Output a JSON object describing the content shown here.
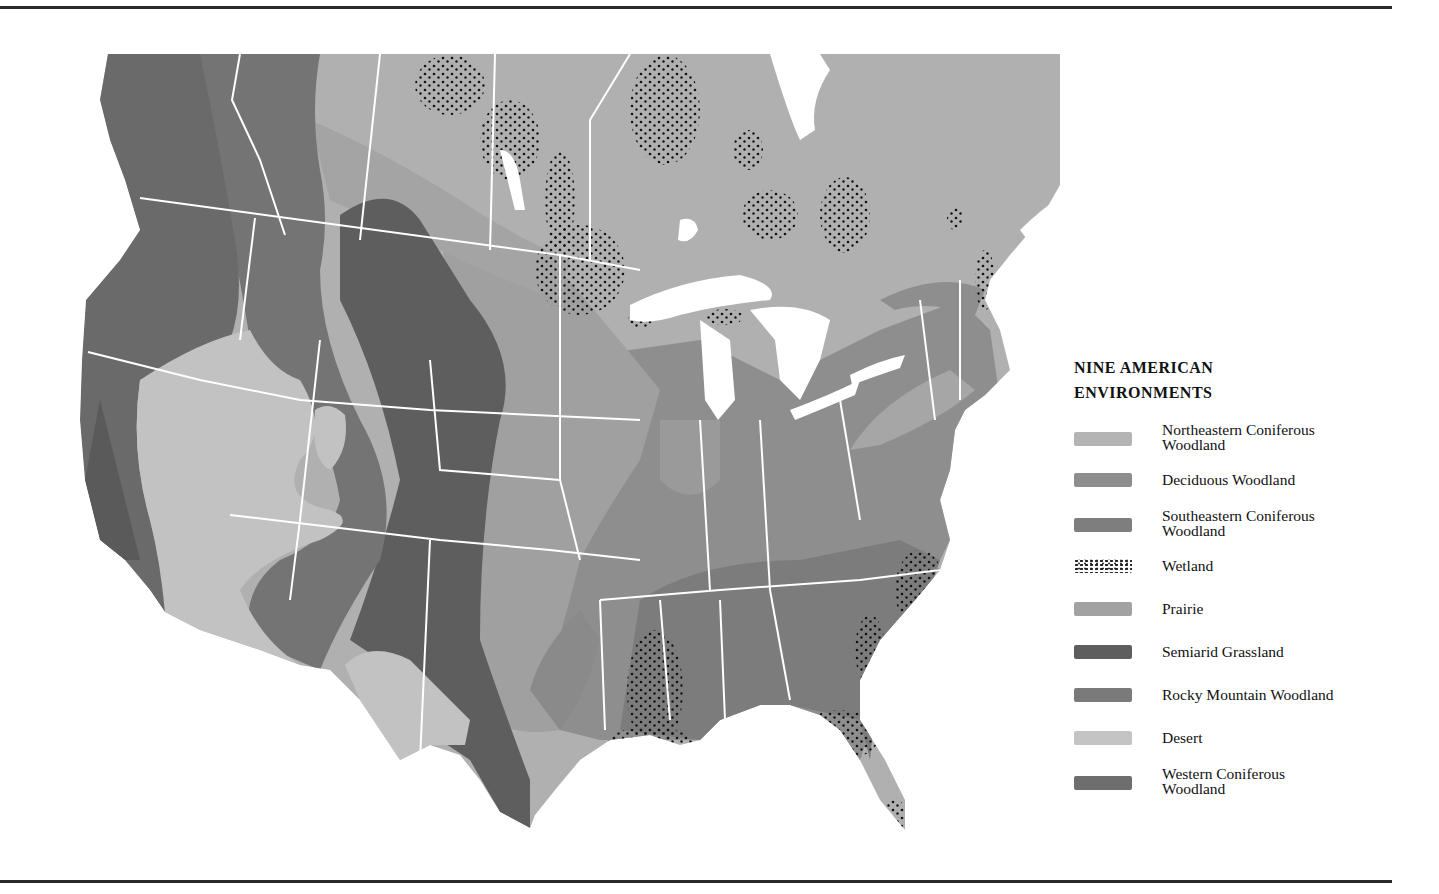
{
  "legend": {
    "title_line1": "NINE AMERICAN",
    "title_line2": "ENVIRONMENTS",
    "items": [
      {
        "label_line1": "Northeastern Coniferous",
        "label_line2": "Woodland",
        "color": "#b4b4b4",
        "pattern": "solid"
      },
      {
        "label_line1": "Deciduous Woodland",
        "label_line2": "",
        "color": "#8e8e8e",
        "pattern": "solid"
      },
      {
        "label_line1": "Southeastern Coniferous",
        "label_line2": "Woodland",
        "color": "#7e7e7e",
        "pattern": "solid"
      },
      {
        "label_line1": "Wetland",
        "label_line2": "",
        "color": "#222222",
        "pattern": "dots"
      },
      {
        "label_line1": "Prairie",
        "label_line2": "",
        "color": "#a2a2a2",
        "pattern": "solid"
      },
      {
        "label_line1": "Semiarid Grassland",
        "label_line2": "",
        "color": "#5e5e5e",
        "pattern": "solid"
      },
      {
        "label_line1": "Rocky Mountain Woodland",
        "label_line2": "",
        "color": "#7a7a7a",
        "pattern": "solid"
      },
      {
        "label_line1": "Desert",
        "label_line2": "",
        "color": "#c4c4c4",
        "pattern": "solid"
      },
      {
        "label_line1": "Western Coniferous",
        "label_line2": "Woodland",
        "color": "#6e6e6e",
        "pattern": "solid"
      }
    ]
  },
  "map": {
    "region": "North America (United States and southern Canada)",
    "water_color": "#ffffff",
    "border_color": "#ffffff",
    "wetland_areas": [
      "Northern Saskatchewan/Manitoba",
      "Manitoba lakes",
      "Northern Ontario",
      "Western Quebec",
      "St. Lawrence valley",
      "Lower Mississippi / Louisiana",
      "Carolina coast",
      "Florida / Gulf coast",
      "Lake Superior shore"
    ]
  }
}
